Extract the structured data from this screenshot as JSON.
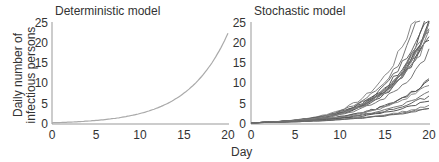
{
  "chart_data": [
    {
      "type": "line",
      "title": "Deterministic model",
      "xlabel": "Day",
      "ylabel": "Daily number of infectious persons",
      "xlim": [
        0,
        20
      ],
      "ylim": [
        0,
        25
      ],
      "xticks": [
        0,
        5,
        10,
        15,
        20
      ],
      "yticks": [
        0,
        5,
        10,
        15,
        20,
        25
      ],
      "grid": false,
      "series": [
        {
          "name": "deterministic",
          "x": [
            0,
            2,
            4,
            6,
            8,
            10,
            12,
            14,
            16,
            18,
            20
          ],
          "values": [
            0.3,
            0.6,
            0.9,
            1.3,
            2.0,
            2.9,
            4.3,
            6.3,
            9.5,
            14.5,
            22.5
          ]
        }
      ]
    },
    {
      "type": "line",
      "title": "Stochastic model",
      "xlabel": "Day",
      "ylabel": "Daily number of infectious persons",
      "xlim": [
        0,
        20
      ],
      "ylim": [
        0,
        25
      ],
      "xticks": [
        0,
        5,
        10,
        15,
        20
      ],
      "yticks": [
        0,
        5,
        10,
        15,
        20,
        25
      ],
      "grid": false,
      "note": "Approximately 20 stochastic realizations; endpoints at day 20 range from ~4 to >25",
      "series_endpoints_day20": [
        25,
        25,
        25,
        25,
        25,
        24,
        23,
        22,
        22,
        18,
        11,
        11,
        10,
        8,
        7,
        6,
        4.5,
        4,
        3.8
      ]
    }
  ],
  "labels": {
    "left_title": "Deterministic model",
    "right_title": "Stochastic model",
    "ylabel_line1": "Daily number of",
    "ylabel_line2": "infectious persons",
    "xlabel": "Day",
    "yticks": [
      "25",
      "20",
      "15",
      "10",
      "5",
      "0"
    ],
    "xticks": [
      "0",
      "5",
      "10",
      "15",
      "20"
    ]
  },
  "colors": {
    "axis": "#999999",
    "deterministic_line": "#aaaaaa",
    "stochastic_lines": [
      "#888888",
      "#777777",
      "#666666",
      "#555555"
    ]
  }
}
